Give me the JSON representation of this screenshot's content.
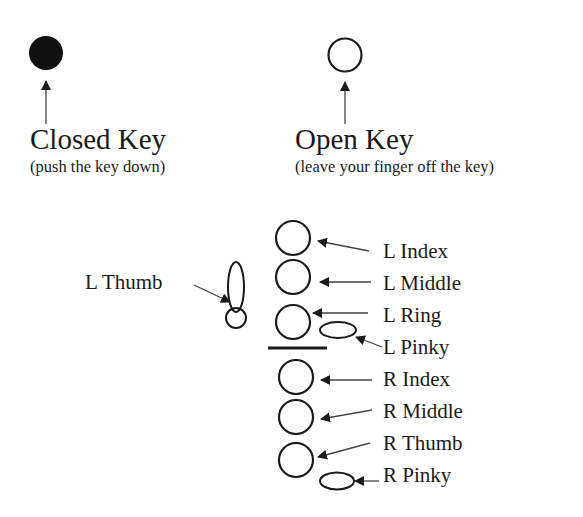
{
  "legend": {
    "closed": {
      "title": "Closed Key",
      "subtitle": "(push the key down)",
      "icon": "filled-circle-icon"
    },
    "open": {
      "title": "Open Key",
      "subtitle": "(leave your finger off the key)",
      "icon": "open-circle-icon"
    }
  },
  "fingering": {
    "left_thumb": "L Thumb",
    "keys": [
      {
        "label": "L Index",
        "shape": "circle"
      },
      {
        "label": "L Middle",
        "shape": "circle"
      },
      {
        "label": "L Ring",
        "shape": "circle"
      },
      {
        "label": "L Pinky",
        "shape": "oval"
      },
      {
        "label": "R Index",
        "shape": "circle"
      },
      {
        "label": "R Middle",
        "shape": "circle"
      },
      {
        "label": "R Thumb",
        "shape": "circle"
      },
      {
        "label": "R Pinky",
        "shape": "oval"
      }
    ]
  },
  "colors": {
    "ink": "#1a1a1a",
    "background": "#ffffff"
  }
}
